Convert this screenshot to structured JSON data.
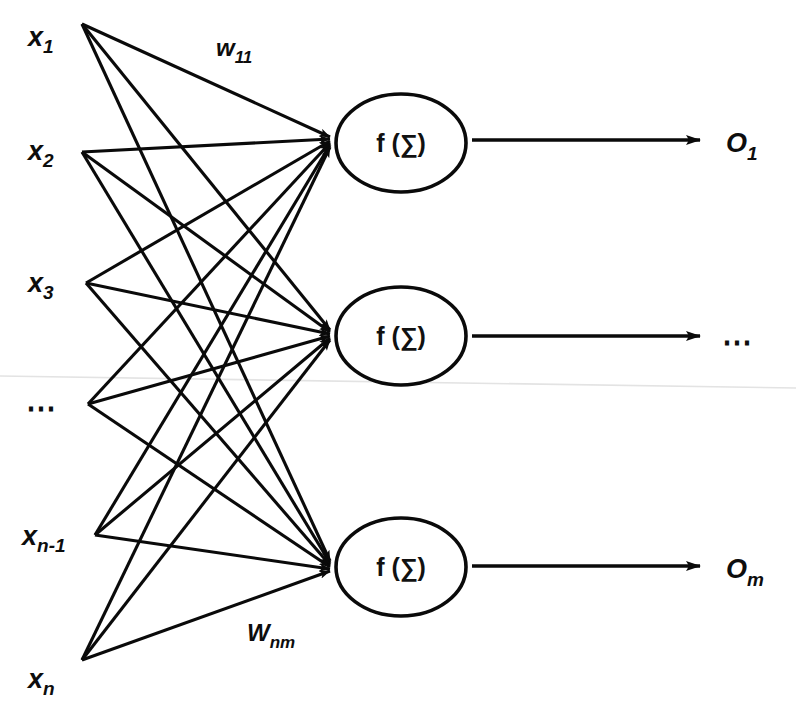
{
  "figure": {
    "background_color": "#ffffff",
    "ink_color": "#0a0a0a",
    "width": 796,
    "height": 705
  },
  "inputs": [
    {
      "id": "x1",
      "label": "x",
      "sub": "1",
      "x": 82,
      "y": 24,
      "label_x": 28,
      "label_y": 46
    },
    {
      "id": "x2",
      "label": "x",
      "sub": "2",
      "x": 82,
      "y": 152,
      "label_x": 28,
      "label_y": 160
    },
    {
      "id": "x3",
      "label": "x",
      "sub": "3",
      "x": 86,
      "y": 283,
      "label_x": 28,
      "label_y": 292
    },
    {
      "id": "xdots",
      "label": "⋯",
      "sub": "",
      "x": 88,
      "y": 404,
      "label_x": 26,
      "label_y": 418
    },
    {
      "id": "xn1",
      "label": "x",
      "sub": "n-1",
      "x": 95,
      "y": 535,
      "label_x": 22,
      "label_y": 545
    },
    {
      "id": "xn",
      "label": "x",
      "sub": "n",
      "x": 82,
      "y": 660,
      "label_x": 28,
      "label_y": 688
    }
  ],
  "neurons": [
    {
      "id": "neuron-1",
      "text": "f (∑)",
      "cx": 401,
      "cy": 143,
      "rx": 65,
      "ry": 49
    },
    {
      "id": "neuron-2",
      "text": "f (∑)",
      "cx": 401,
      "cy": 336,
      "rx": 65,
      "ry": 49
    },
    {
      "id": "neuron-3",
      "text": "f (∑)",
      "cx": 401,
      "cy": 567,
      "rx": 65,
      "ry": 49
    }
  ],
  "outputs": [
    {
      "id": "o1",
      "label": "O",
      "sub": "1",
      "line_x1": 472,
      "line_x2": 700,
      "y": 140,
      "label_x": 726,
      "label_y": 152
    },
    {
      "id": "odots",
      "label": "⋯",
      "sub": "",
      "line_x1": 472,
      "line_x2": 700,
      "y": 336,
      "label_x": 722,
      "label_y": 352
    },
    {
      "id": "om",
      "label": "O",
      "sub": "m",
      "line_x1": 472,
      "line_x2": 700,
      "y": 566,
      "label_x": 726,
      "label_y": 578
    }
  ],
  "weights": [
    {
      "id": "w11",
      "label": "w",
      "sub": "11",
      "x": 216,
      "y": 56,
      "title": "first input to first neuron weight"
    },
    {
      "id": "wnm",
      "label": "W",
      "sub": "nm",
      "x": 247,
      "y": 641,
      "title": "nth input to mth neuron weight"
    }
  ],
  "edges_note": "Every input node connects to every neuron node (fully connected), arrowheads at neuron left edge.",
  "annotations": {
    "scan_artifact": "faint horizontal scan line across page at y approx 380"
  }
}
